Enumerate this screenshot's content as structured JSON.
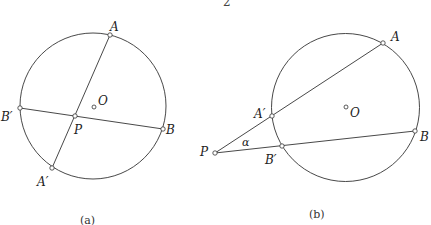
{
  "page_number": "2",
  "figures": [
    {
      "id": "a",
      "caption": "(a)",
      "circle": {
        "cx": 93,
        "cy": 106,
        "r": 73
      },
      "center_label": "O",
      "points": {
        "A": {
          "x": 110,
          "y": 35,
          "label": "A"
        },
        "A_prime": {
          "x": 52,
          "y": 168,
          "label": "A′"
        },
        "B": {
          "x": 163,
          "y": 129,
          "label": "B"
        },
        "B_prime": {
          "x": 20,
          "y": 108,
          "label": "B′"
        },
        "P": {
          "x": 75,
          "y": 116,
          "label": "P"
        },
        "O": {
          "x": 94,
          "y": 107,
          "label": "O"
        }
      },
      "chords": [
        "A–A′",
        "B–B′"
      ]
    },
    {
      "id": "b",
      "caption": "(b)",
      "circle": {
        "cx": 345.5,
        "cy": 107.5,
        "r": 74
      },
      "center_label": "O",
      "angle_label": "α",
      "points": {
        "A": {
          "x": 383,
          "y": 43,
          "label": "A"
        },
        "A_prime": {
          "x": 272,
          "y": 116,
          "label": "A′"
        },
        "B": {
          "x": 415,
          "y": 131,
          "label": "B"
        },
        "B_prime": {
          "x": 282,
          "y": 146,
          "label": "B′"
        },
        "P": {
          "x": 215,
          "y": 153,
          "label": "P"
        },
        "O": {
          "x": 346,
          "y": 107,
          "label": "O"
        }
      },
      "secants": [
        "P–A",
        "P–B"
      ]
    }
  ]
}
